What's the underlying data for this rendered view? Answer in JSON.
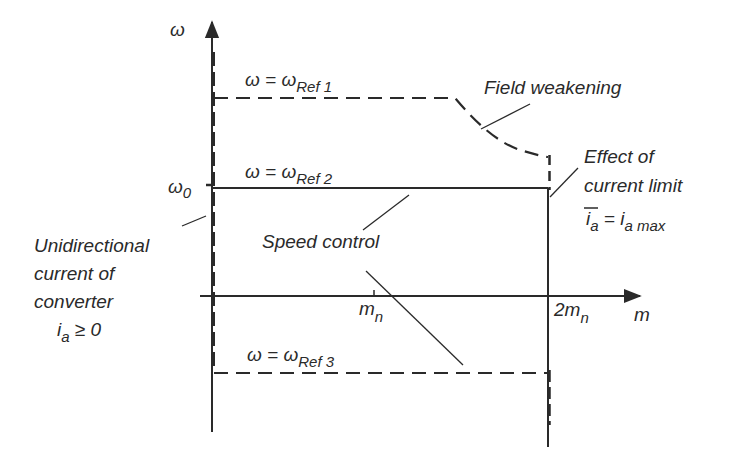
{
  "diagram": {
    "type": "torque-speed operating region",
    "axes": {
      "y_label": "ω",
      "x_label": "m",
      "y_tick_label": "ω",
      "y_tick_sub": "0",
      "x_ticks": [
        {
          "label": "m",
          "sub": "n"
        },
        {
          "label": "2m",
          "sub": "n"
        }
      ]
    },
    "curves": [
      {
        "id": "ref1",
        "eq": "ω = ω",
        "sub": "Ref 1",
        "style": "dashed"
      },
      {
        "id": "ref2",
        "eq": "ω = ω",
        "sub": "Ref 2",
        "style": "solid"
      },
      {
        "id": "ref3",
        "eq": "ω = ω",
        "sub": "Ref 3",
        "style": "dashed"
      }
    ],
    "annotations": {
      "field_weakening": "Field weakening",
      "current_limit_line1": "Effect of",
      "current_limit_line2": "current limit",
      "current_limit_eq_i": "i",
      "current_limit_eq_sub": "a",
      "current_limit_eq_rhs": " = i",
      "current_limit_eq_rhs_sub": "a max",
      "speed_control": "Speed control",
      "unidirectional_line1": "Unidirectional",
      "unidirectional_line2": "current  of",
      "unidirectional_line3": "converter",
      "unidirectional_eq_i": "i",
      "unidirectional_eq_sub": "a",
      "unidirectional_eq_rhs": " ≥ 0"
    }
  }
}
